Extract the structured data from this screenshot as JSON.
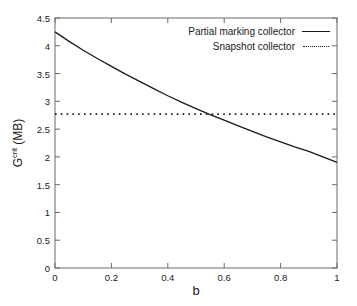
{
  "chart_data": {
    "type": "line",
    "title": "",
    "xlabel": "b",
    "ylabel": "G^crit (MB)",
    "ylabel_base": "G",
    "ylabel_sup": "crit",
    "ylabel_unit": " (MB)",
    "xlim": [
      0,
      1
    ],
    "ylim": [
      0,
      4.5
    ],
    "xticks": [
      "0",
      "0.2",
      "0.4",
      "0.6",
      "0.8",
      "1"
    ],
    "xtick_values": [
      0,
      0.2,
      0.4,
      0.6,
      0.8,
      1
    ],
    "yticks": [
      "0",
      "0.5",
      "1",
      "1.5",
      "2",
      "2.5",
      "3",
      "3.5",
      "4",
      "4.5"
    ],
    "ytick_values": [
      0,
      0.5,
      1,
      1.5,
      2,
      2.5,
      3,
      3.5,
      4,
      4.5
    ],
    "grid": false,
    "legend_position": "top-right",
    "series": [
      {
        "name": "Partial marking collector",
        "style": "solid",
        "color": "#1a1a1a",
        "x": [
          0,
          0.05,
          0.1,
          0.15,
          0.2,
          0.25,
          0.3,
          0.35,
          0.4,
          0.45,
          0.5,
          0.55,
          0.6,
          0.65,
          0.7,
          0.75,
          0.8,
          0.85,
          0.9,
          0.95,
          1
        ],
        "values": [
          4.25,
          4.08,
          3.92,
          3.77,
          3.63,
          3.49,
          3.36,
          3.23,
          3.1,
          2.98,
          2.87,
          2.76,
          2.66,
          2.56,
          2.46,
          2.36,
          2.27,
          2.18,
          2.1,
          2.0,
          1.9
        ]
      },
      {
        "name": "Snapshot collector",
        "style": "dotted",
        "color": "#1a1a1a",
        "constant_y": 2.77,
        "x": [
          0,
          1
        ],
        "values": [
          2.77,
          2.77
        ]
      }
    ],
    "intersection": {
      "x": 0.43,
      "y": 2.77
    }
  },
  "legend": {
    "entries": [
      {
        "label": "Partial marking collector",
        "sample": "solid-line-sample"
      },
      {
        "label": "Snapshot collector",
        "sample": "dotted-line-sample"
      }
    ]
  }
}
